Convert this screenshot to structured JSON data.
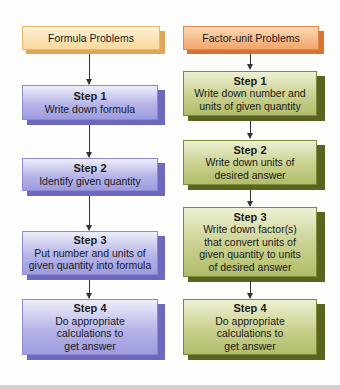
{
  "columns": {
    "left": {
      "header": "Formula Problems",
      "header_color": "#f9d99c",
      "box_color": "#b6b5e8",
      "steps": [
        {
          "title": "Step 1",
          "lines": [
            "Write down formula"
          ]
        },
        {
          "title": "Step 2",
          "lines": [
            "Identify given quantity"
          ]
        },
        {
          "title": "Step 3",
          "lines": [
            "Put number and units of",
            "given quantity into formula"
          ]
        },
        {
          "title": "Step 4",
          "lines": [
            "Do appropriate",
            "calculations to",
            "get answer"
          ]
        }
      ]
    },
    "right": {
      "header": "Factor-unit Problems",
      "header_color": "#f3a56b",
      "box_color": "#c9d08e",
      "steps": [
        {
          "title": "Step 1",
          "lines": [
            "Write down number and",
            "units of given quantity"
          ]
        },
        {
          "title": "Step 2",
          "lines": [
            "Write down units of",
            "desired answer"
          ]
        },
        {
          "title": "Step 3",
          "lines": [
            "Write down factor(s)",
            "that convert units of",
            "given quantity to units",
            "of desired answer"
          ]
        },
        {
          "title": "Step 4",
          "lines": [
            "Do appropriate",
            "calculations to",
            "get answer"
          ]
        }
      ]
    }
  }
}
